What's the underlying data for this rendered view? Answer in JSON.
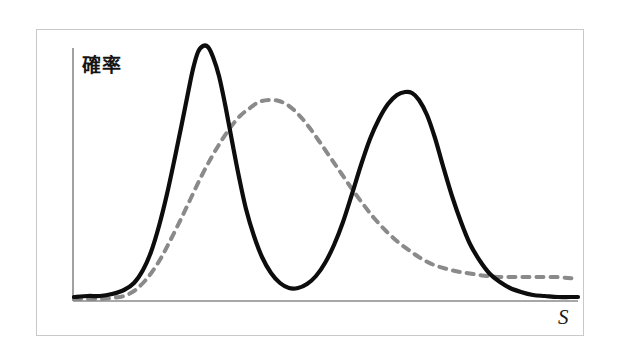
{
  "figure": {
    "caption_none": "",
    "background_color": "#ffffff",
    "frame_color": "#c9c9c9"
  },
  "axes": {
    "y_label": "確率",
    "x_label": "S",
    "axis_color": "#8a8a8a",
    "y_axis_x": 73,
    "y_axis_top": 48,
    "y_axis_bottom": 301,
    "x_axis_y": 301,
    "x_axis_left": 73,
    "x_axis_right": 578
  },
  "chart_data": {
    "type": "line",
    "title": "",
    "xlabel": "S",
    "ylabel": "確率",
    "grid": false,
    "legend": "none",
    "xlim": [
      73,
      580
    ],
    "ylim_pixels": [
      301,
      45
    ],
    "annotation": "Two overlapping probability distributions: a bimodal solid black curve and a unimodal broad dashed gray curve.",
    "series": [
      {
        "name": "solid-bimodal-distribution",
        "style": "solid",
        "color": "#0d0d0d",
        "width": 4.2,
        "description": "Bimodal distribution with a tall narrow first mode, deep valley, and a second mode of slightly lower height with a long right tail.",
        "features": {
          "peak1_x": 198,
          "peak1_y": 47,
          "valley_x": 296,
          "valley_y": 288,
          "peak2_x": 410,
          "peak2_y": 92,
          "baseline_y": 297
        },
        "points": [
          [
            74,
            297
          ],
          [
            88,
            296
          ],
          [
            100,
            296
          ],
          [
            112,
            294
          ],
          [
            124,
            290
          ],
          [
            134,
            283
          ],
          [
            143,
            270
          ],
          [
            151,
            252
          ],
          [
            159,
            226
          ],
          [
            167,
            194
          ],
          [
            175,
            157
          ],
          [
            182,
            123
          ],
          [
            188,
            93
          ],
          [
            193,
            69
          ],
          [
            198,
            52
          ],
          [
            203,
            46
          ],
          [
            208,
            47
          ],
          [
            213,
            57
          ],
          [
            219,
            76
          ],
          [
            225,
            104
          ],
          [
            232,
            141
          ],
          [
            239,
            177
          ],
          [
            246,
            209
          ],
          [
            254,
            236
          ],
          [
            262,
            257
          ],
          [
            271,
            273
          ],
          [
            280,
            283
          ],
          [
            289,
            288
          ],
          [
            298,
            288
          ],
          [
            307,
            284
          ],
          [
            316,
            276
          ],
          [
            325,
            263
          ],
          [
            334,
            245
          ],
          [
            343,
            222
          ],
          [
            352,
            194
          ],
          [
            361,
            165
          ],
          [
            370,
            139
          ],
          [
            379,
            119
          ],
          [
            388,
            104
          ],
          [
            397,
            95
          ],
          [
            405,
            92
          ],
          [
            412,
            93
          ],
          [
            419,
            100
          ],
          [
            427,
            115
          ],
          [
            435,
            138
          ],
          [
            443,
            166
          ],
          [
            452,
            196
          ],
          [
            461,
            222
          ],
          [
            470,
            244
          ],
          [
            480,
            261
          ],
          [
            490,
            274
          ],
          [
            500,
            282
          ],
          [
            510,
            288
          ],
          [
            521,
            292
          ],
          [
            533,
            295
          ],
          [
            545,
            296
          ],
          [
            558,
            297
          ],
          [
            570,
            297
          ],
          [
            578,
            297
          ]
        ]
      },
      {
        "name": "dashed-unimodal-distribution",
        "style": "dashed",
        "color": "#8a8a8a",
        "width": 4.0,
        "dash_pattern": "7 7",
        "description": "Broad right-skewed unimodal distribution peaking between the two solid modes, with a heavy flattening right tail that crosses above the solid curve near the right edge.",
        "features": {
          "peak_x": 269,
          "peak_y": 100,
          "baseline_y": 298,
          "tail_plateau_y": 277,
          "crossover_x": 511
        },
        "points": [
          [
            74,
            299
          ],
          [
            88,
            299
          ],
          [
            100,
            299
          ],
          [
            112,
            298
          ],
          [
            124,
            296
          ],
          [
            134,
            291
          ],
          [
            143,
            283
          ],
          [
            152,
            272
          ],
          [
            161,
            258
          ],
          [
            170,
            241
          ],
          [
            180,
            221
          ],
          [
            190,
            200
          ],
          [
            200,
            179
          ],
          [
            210,
            160
          ],
          [
            220,
            143
          ],
          [
            230,
            128
          ],
          [
            240,
            116
          ],
          [
            250,
            108
          ],
          [
            259,
            102
          ],
          [
            269,
            100
          ],
          [
            279,
            101
          ],
          [
            289,
            106
          ],
          [
            299,
            115
          ],
          [
            309,
            127
          ],
          [
            319,
            141
          ],
          [
            330,
            157
          ],
          [
            341,
            173
          ],
          [
            352,
            189
          ],
          [
            363,
            204
          ],
          [
            374,
            218
          ],
          [
            386,
            231
          ],
          [
            398,
            242
          ],
          [
            410,
            251
          ],
          [
            422,
            259
          ],
          [
            434,
            265
          ],
          [
            447,
            269
          ],
          [
            460,
            272
          ],
          [
            473,
            274
          ],
          [
            487,
            276
          ],
          [
            500,
            277
          ],
          [
            514,
            277
          ],
          [
            528,
            277
          ],
          [
            542,
            277
          ],
          [
            556,
            277
          ],
          [
            568,
            278
          ],
          [
            578,
            279
          ]
        ]
      }
    ]
  }
}
